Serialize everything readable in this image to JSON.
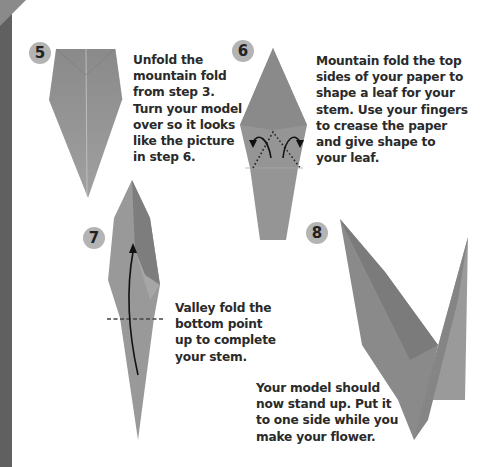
{
  "page": {
    "colors": {
      "sidebar": "#606060",
      "paper": "#8f8f8f",
      "badge": "#b4b4b4",
      "text": "#2a2a2a"
    }
  },
  "steps": [
    {
      "number": "5",
      "lines": [
        "Unfold the",
        "mountain fold",
        "from step 3.",
        "Turn your model",
        "over so it looks",
        "like the picture",
        "in step 6."
      ]
    },
    {
      "number": "6",
      "lines": [
        "Mountain fold the top",
        "sides of your paper to",
        "shape a leaf for your",
        "stem. Use your fingers",
        "to crease the paper",
        "and give shape to",
        "your leaf."
      ],
      "icons": [
        "mountain-fold-arrow-left-icon",
        "mountain-fold-arrow-right-icon"
      ]
    },
    {
      "number": "7",
      "lines": [
        "Valley fold the",
        "bottom point",
        "up to complete",
        "your stem."
      ],
      "icons": [
        "valley-fold-arrow-up-icon"
      ]
    },
    {
      "number": "8",
      "lines": [
        "Your model should",
        "now stand up. Put it",
        "to one side while you",
        "make your flower."
      ]
    }
  ]
}
